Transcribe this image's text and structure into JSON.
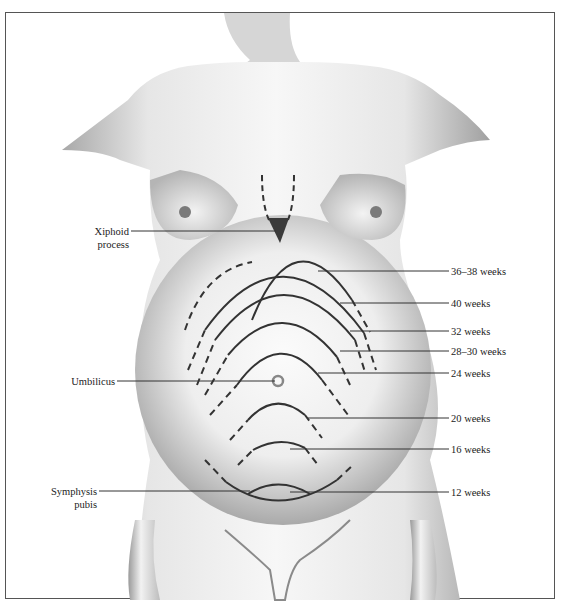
{
  "figure": {
    "left_labels": [
      {
        "id": "xiphoid",
        "lines": [
          "Xiphoid",
          "process"
        ]
      },
      {
        "id": "umbilicus",
        "lines": [
          "Umbilicus"
        ]
      },
      {
        "id": "symphysis",
        "lines": [
          "Symphysis",
          "pubis"
        ]
      }
    ],
    "right_labels": [
      {
        "id": "w36",
        "text": "36–38 weeks"
      },
      {
        "id": "w40",
        "text": "40 weeks"
      },
      {
        "id": "w32",
        "text": "32 weeks"
      },
      {
        "id": "w28",
        "text": "28–30 weeks"
      },
      {
        "id": "w24",
        "text": "24 weeks"
      },
      {
        "id": "w20",
        "text": "20 weeks"
      },
      {
        "id": "w16",
        "text": "16 weeks"
      },
      {
        "id": "w12",
        "text": "12 weeks"
      }
    ],
    "colors": {
      "line": "#333333",
      "marker": "#3a3a3a",
      "skin_dark": "#8a8a8a",
      "skin_light": "#f4f4f4"
    }
  }
}
